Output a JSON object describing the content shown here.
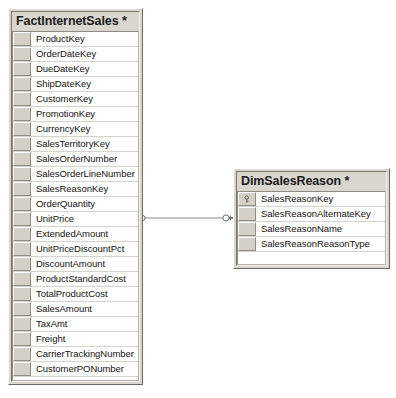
{
  "diagram": {
    "background_color": "#ffffff",
    "entity_fill": "#d9d6ce",
    "grid_fill": "#ffffff",
    "line_color": "#808080"
  },
  "entities": [
    {
      "name": "fact-internet-sales",
      "title": "FactInternetSales *",
      "modified_marker": "*",
      "fields": [
        {
          "label": "ProductKey",
          "primary_key": false
        },
        {
          "label": "OrderDateKey",
          "primary_key": false
        },
        {
          "label": "DueDateKey",
          "primary_key": false
        },
        {
          "label": "ShipDateKey",
          "primary_key": false
        },
        {
          "label": "CustomerKey",
          "primary_key": false
        },
        {
          "label": "PromotionKey",
          "primary_key": false
        },
        {
          "label": "CurrencyKey",
          "primary_key": false
        },
        {
          "label": "SalesTerritoryKey",
          "primary_key": false
        },
        {
          "label": "SalesOrderNumber",
          "primary_key": false
        },
        {
          "label": "SalesOrderLineNumber",
          "primary_key": false
        },
        {
          "label": "SalesReasonKey",
          "primary_key": false
        },
        {
          "label": "OrderQuantity",
          "primary_key": false
        },
        {
          "label": "UnitPrice",
          "primary_key": false
        },
        {
          "label": "ExtendedAmount",
          "primary_key": false
        },
        {
          "label": "UnitPriceDiscountPct",
          "primary_key": false
        },
        {
          "label": "DiscountAmount",
          "primary_key": false
        },
        {
          "label": "ProductStandardCost",
          "primary_key": false
        },
        {
          "label": "TotalProductCost",
          "primary_key": false
        },
        {
          "label": "SalesAmount",
          "primary_key": false
        },
        {
          "label": "TaxAmt",
          "primary_key": false
        },
        {
          "label": "Freight",
          "primary_key": false
        },
        {
          "label": "CarrierTrackingNumber",
          "primary_key": false
        },
        {
          "label": "CustomerPONumber",
          "primary_key": false
        }
      ]
    },
    {
      "name": "dim-sales-reason",
      "title": "DimSalesReason *",
      "modified_marker": "*",
      "fields": [
        {
          "label": "SalesReasonKey",
          "primary_key": true
        },
        {
          "label": "SalesReasonAlternateKey",
          "primary_key": false
        },
        {
          "label": "SalesReasonName",
          "primary_key": false
        },
        {
          "label": "SalesReasonReasonType",
          "primary_key": false
        }
      ]
    }
  ],
  "relationship": {
    "name": "fk-fact-internet-sales-dim-sales-reason",
    "from_entity": "FactInternetSales",
    "to_entity": "DimSalesReason",
    "from_cardinality": "many",
    "to_cardinality": "one",
    "from_symbol": "crows-foot",
    "to_symbol": "key"
  }
}
